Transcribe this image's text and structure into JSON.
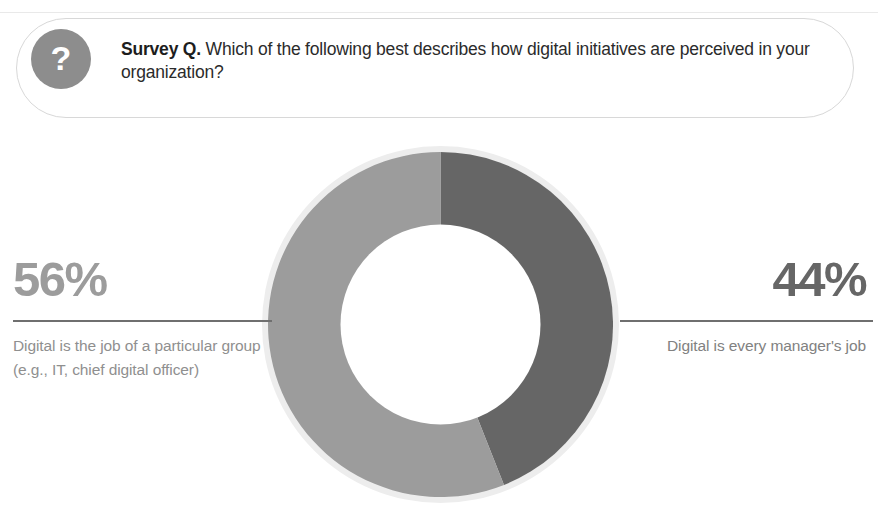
{
  "survey": {
    "badge_icon": "question-mark-icon",
    "badge_symbol": "?",
    "label": "Survey Q.",
    "question": "Which of the following best describes how digital initiatives are perceived in your organization?"
  },
  "stats": {
    "left": {
      "value": "56%",
      "description": "Digital is the job of a particular group (e.g., IT, chief digital officer)"
    },
    "right": {
      "value": "44%",
      "description": "Digital is every manager's job"
    }
  },
  "colors": {
    "segment_light": "#9c9c9c",
    "segment_dark": "#666666",
    "halo": "#ededed",
    "badge": "#8d8d8d",
    "rule": "#6f6f6f",
    "pill_border": "#d8d8d8",
    "text_dark": "#2b2b2b",
    "text_muted": "#8f8f8f"
  },
  "chart_data": {
    "type": "pie",
    "variant": "donut",
    "title": "Which of the following best describes how digital initiatives are perceived in your organization?",
    "categories": [
      "Digital is every manager's job",
      "Digital is the job of a particular group (e.g., IT, chief digital officer)"
    ],
    "values": [
      44,
      56
    ],
    "labels": [
      "44%",
      "56%"
    ],
    "colors": [
      "#666666",
      "#9c9c9c"
    ],
    "units": "percent",
    "total": 100,
    "start_angle_deg": 0,
    "direction": "clockwise",
    "inner_radius_ratio": 0.58,
    "legend": "none",
    "grid": false,
    "annotations": [
      "44% label with rule on the right side",
      "56% label with rule on the left side"
    ]
  }
}
